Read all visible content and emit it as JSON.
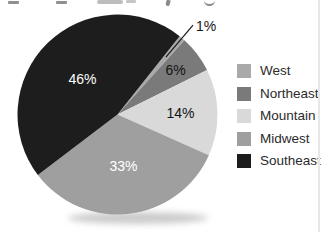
{
  "chart_data": {
    "type": "pie",
    "total": 100,
    "start_angle_deg": 38.4,
    "direction": "clockwise",
    "slices": [
      {
        "label": "West",
        "value": 1,
        "pct_label": "1%",
        "color": "#a9a9a9",
        "label_color": "#161616",
        "label_placement": "outside",
        "label_r": 1.17
      },
      {
        "label": "Northeast",
        "value": 6,
        "pct_label": "6%",
        "color": "#7a7a7a",
        "label_color": "#141414",
        "label_placement": "inside",
        "label_r": 0.73
      },
      {
        "label": "Mountain",
        "value": 14,
        "pct_label": "14%",
        "color": "#d9d9d9",
        "label_color": "#141414",
        "label_placement": "inside",
        "label_r": 0.63
      },
      {
        "label": "Midwest",
        "value": 33,
        "pct_label": "33%",
        "color": "#9f9f9f",
        "label_color": "#ffffff",
        "label_placement": "inside",
        "label_r": 0.52
      },
      {
        "label": "Southeast",
        "value": 46,
        "pct_label": "46%",
        "color": "#1d1d1d",
        "label_color": "#ffffff",
        "label_placement": "inside",
        "label_r": 0.5
      }
    ],
    "legend": {
      "position": "right",
      "entries": [
        "West",
        "Northeast",
        "Mountain",
        "Midwest",
        "Southeast"
      ]
    },
    "leader_line": {
      "slice": "West",
      "color": "#1a1a1a"
    },
    "shadow_color": "#8c8c8c"
  }
}
